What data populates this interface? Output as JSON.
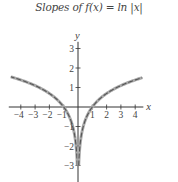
{
  "chart_data": {
    "type": "line",
    "title": "Slopes of f(x) = ln |x|",
    "xlabel": "x",
    "ylabel": "y",
    "xlim": [
      -4.7,
      4.5
    ],
    "ylim": [
      -3.6,
      3.6
    ],
    "x_ticks": [
      -4,
      -3,
      -2,
      -1,
      1,
      2,
      3,
      4
    ],
    "x_tick_labels": [
      "−4",
      "−3",
      "−2",
      "−1",
      "1",
      "2",
      "3",
      "4"
    ],
    "y_ticks": [
      -3,
      -2,
      -1,
      1,
      2,
      3
    ],
    "y_tick_labels": [
      "−3",
      "−2",
      "−1",
      "1",
      "2",
      "3"
    ],
    "grid": false,
    "legend": null,
    "series": [
      {
        "name": "f(x) = ln|x|, x < 0",
        "function": "ln(-x)",
        "x": [
          -4.7,
          -4,
          -3,
          -2,
          -1.5,
          -1,
          -0.7,
          -0.5,
          -0.3,
          -0.2,
          -0.1,
          -0.05
        ],
        "y": [
          1.55,
          1.39,
          1.1,
          0.69,
          0.41,
          0,
          -0.36,
          -0.69,
          -1.2,
          -1.61,
          -2.3,
          -3.0
        ],
        "style": "solid curve with dashed slope-segment overlay"
      },
      {
        "name": "f(x) = ln|x|, x > 0",
        "function": "ln(x)",
        "x": [
          0.05,
          0.1,
          0.2,
          0.3,
          0.5,
          0.7,
          1,
          1.5,
          2,
          3,
          4,
          4.5
        ],
        "y": [
          -3.0,
          -2.3,
          -1.61,
          -1.2,
          -0.69,
          -0.36,
          0,
          0.41,
          0.69,
          1.1,
          1.39,
          1.5
        ],
        "style": "solid curve with dashed slope-segment overlay"
      }
    ],
    "colors": {
      "curve": "#555555",
      "slope_segments": "#aaaaaa",
      "axes": "#333333"
    }
  }
}
